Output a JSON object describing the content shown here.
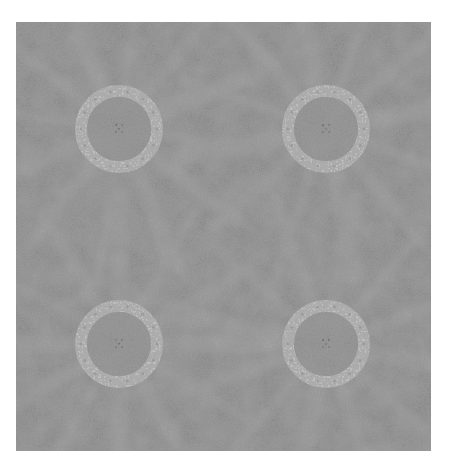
{
  "image": {
    "description": "Grayscale textured decorative tile pattern with four light rings and radiating light bands",
    "colors": {
      "background_page": "#ffffff",
      "base_gray": "#878787",
      "dark_speckle": "#6e6e6e",
      "ray_light": "#9d9d9d",
      "ring_light": "#bdbdbd",
      "ring_inner": "#8f8f8f"
    },
    "rings": [
      {
        "id": "top-left",
        "cx": 103,
        "cy": 107
      },
      {
        "id": "top-right",
        "cx": 310,
        "cy": 107
      },
      {
        "id": "bottom-left",
        "cx": 103,
        "cy": 322
      },
      {
        "id": "bottom-right",
        "cx": 310,
        "cy": 322
      }
    ],
    "ring_outer_radius": 44,
    "ring_inner_radius": 32
  }
}
